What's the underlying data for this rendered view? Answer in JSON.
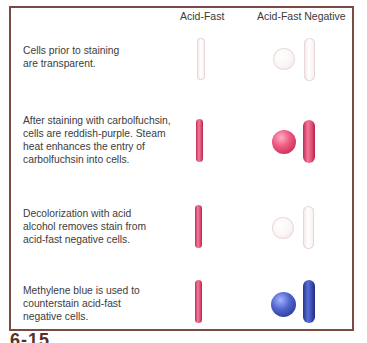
{
  "figure": {
    "label": "6-15",
    "border_color": "#7a4a45"
  },
  "columns": {
    "acid_fast": "Acid-Fast",
    "acid_fast_negative": "Acid-Fast Negative"
  },
  "rows": [
    {
      "step": "prior-to-staining",
      "lines": [
        "Cells prior to staining",
        "are transparent."
      ],
      "acid_fast_color": "transparent",
      "negative_color": "transparent"
    },
    {
      "step": "carbolfuchsin",
      "lines": [
        "After staining with carbolfuchsin,",
        "cells are reddish-purple. Steam",
        "heat enhances the entry of",
        "carbolfuchsin into cells."
      ],
      "acid_fast_color": "#e04a73",
      "negative_color": "#e04a73"
    },
    {
      "step": "decolorization",
      "lines": [
        "Decolorization with acid",
        "alcohol removes stain from",
        "acid-fast negative cells."
      ],
      "acid_fast_color": "#e04a73",
      "negative_color": "transparent"
    },
    {
      "step": "counterstain",
      "lines": [
        "Methylene blue is used to",
        "counterstain acid-fast",
        "negative cells."
      ],
      "acid_fast_color": "#e04a73",
      "negative_color": "#3b4db3"
    }
  ]
}
